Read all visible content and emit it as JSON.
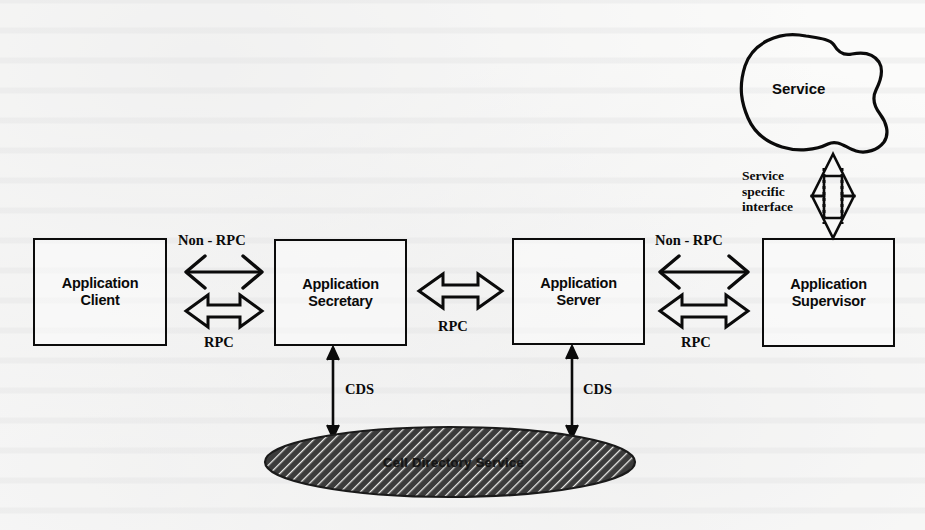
{
  "diagram": {
    "colors": {
      "stroke": "#0b0b0b",
      "background": "#fbfbfa",
      "hatch_fill": "#3a3a3a"
    },
    "nodes": [
      {
        "id": "application-client",
        "label": "Application\nClient"
      },
      {
        "id": "application-secretary",
        "label": "Application\nSecretary"
      },
      {
        "id": "application-server",
        "label": "Application\nServer"
      },
      {
        "id": "application-supervisor",
        "label": "Application\nSupervisor"
      }
    ],
    "service_blob": {
      "label": "Service"
    },
    "directory_service": {
      "label": "Cell Directory Service"
    },
    "edges": [
      {
        "id": "client-secretary-nonrpc",
        "label": "Non - RPC",
        "style": "thin-double-arrow"
      },
      {
        "id": "client-secretary-rpc",
        "label": "RPC",
        "style": "hollow-double-arrow"
      },
      {
        "id": "secretary-server-rpc",
        "label": "RPC",
        "style": "hollow-double-arrow"
      },
      {
        "id": "server-supervisor-nonrpc",
        "label": "Non - RPC",
        "style": "thin-double-arrow"
      },
      {
        "id": "server-supervisor-rpc",
        "label": "RPC",
        "style": "hollow-double-arrow"
      },
      {
        "id": "secretary-cds",
        "label": "CDS",
        "style": "thin-double-arrow"
      },
      {
        "id": "server-cds",
        "label": "CDS",
        "style": "thin-double-arrow"
      },
      {
        "id": "supervisor-service",
        "label": "Service\nspecific\ninterface",
        "style": "dotted-hollow-double-arrow"
      }
    ]
  }
}
